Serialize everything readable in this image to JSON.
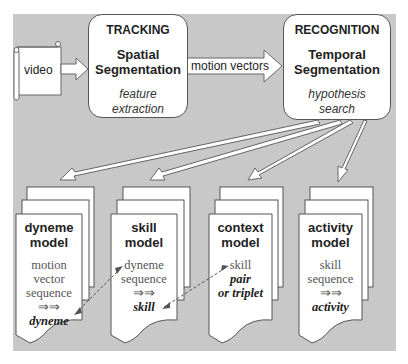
{
  "source": {
    "label": "video"
  },
  "tracking": {
    "heading": "TRACKING",
    "title_line1": "Spatial",
    "title_line2": "Segmentation",
    "sub_line1": "feature",
    "sub_line2": "extraction"
  },
  "connector": {
    "label": "motion vectors"
  },
  "recognition": {
    "heading": "RECOGNITION",
    "title_line1": "Temporal",
    "title_line2": "Segmentation",
    "sub_line1": "hypothesis",
    "sub_line2": "search"
  },
  "models": [
    {
      "title_line1": "dyneme",
      "title_line2": "model",
      "body": [
        "motion",
        "vector",
        "sequence",
        "⇒⇒"
      ],
      "result": "dyneme"
    },
    {
      "title_line1": "skill",
      "title_line2": "model",
      "body": [
        "dyneme",
        "sequence",
        "⇒⇒"
      ],
      "result": "skill"
    },
    {
      "title_line1": "context",
      "title_line2": "model",
      "body": [
        "skill"
      ],
      "result_line1": "pair",
      "result_line2": "or triplet"
    },
    {
      "title_line1": "activity",
      "title_line2": "model",
      "body": [
        "skill",
        "sequence",
        "⇒⇒"
      ],
      "result": "activity"
    }
  ],
  "colors": {
    "background": "#c8c8c8",
    "box_fill": "#ffffff",
    "stroke": "#555555"
  }
}
